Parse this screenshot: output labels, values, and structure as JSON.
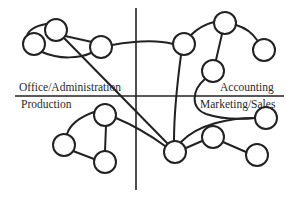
{
  "diagram": {
    "type": "network-quadrant",
    "quadrant_labels": {
      "top_left": "Office/Administration",
      "top_right": "Accounting",
      "bottom_left": "Production",
      "bottom_right": "Marketing/Sales"
    },
    "colors": {
      "stroke": "#222222",
      "node_fill": "#ffffff",
      "text": "#2a2a2a",
      "background": "#ffffff"
    },
    "axes": {
      "vertical": {
        "x": 136,
        "y1": 8,
        "y2": 190
      },
      "horizontal": {
        "y": 96,
        "x1": 15,
        "x2": 284
      }
    },
    "nodes": [
      {
        "id": "A",
        "quadrant": "top_left",
        "cx": 56,
        "cy": 30,
        "r": 11
      },
      {
        "id": "B",
        "quadrant": "top_left",
        "cx": 34,
        "cy": 44,
        "r": 11
      },
      {
        "id": "C",
        "quadrant": "top_left",
        "cx": 101,
        "cy": 47,
        "r": 11
      },
      {
        "id": "D",
        "quadrant": "top_right",
        "cx": 184,
        "cy": 44,
        "r": 11
      },
      {
        "id": "E",
        "quadrant": "top_right",
        "cx": 225,
        "cy": 23,
        "r": 11
      },
      {
        "id": "F",
        "quadrant": "top_right",
        "cx": 264,
        "cy": 50,
        "r": 11
      },
      {
        "id": "G",
        "quadrant": "top_right",
        "cx": 213,
        "cy": 71,
        "r": 11
      },
      {
        "id": "H",
        "quadrant": "bottom_left",
        "cx": 105,
        "cy": 115,
        "r": 11
      },
      {
        "id": "I",
        "quadrant": "bottom_left",
        "cx": 64,
        "cy": 145,
        "r": 11
      },
      {
        "id": "J",
        "quadrant": "bottom_left",
        "cx": 105,
        "cy": 162,
        "r": 11
      },
      {
        "id": "K",
        "quadrant": "bottom_right",
        "cx": 175,
        "cy": 152,
        "r": 11
      },
      {
        "id": "L",
        "quadrant": "bottom_right",
        "cx": 266,
        "cy": 118,
        "r": 11
      },
      {
        "id": "M",
        "quadrant": "bottom_right",
        "cx": 213,
        "cy": 137,
        "r": 11
      },
      {
        "id": "N",
        "quadrant": "bottom_right",
        "cx": 257,
        "cy": 155,
        "r": 11
      }
    ],
    "edges": [
      [
        "A",
        "B"
      ],
      [
        "B",
        "C"
      ],
      [
        "A",
        "C"
      ],
      [
        "A",
        "K"
      ],
      [
        "C",
        "D"
      ],
      [
        "D",
        "E"
      ],
      [
        "E",
        "F"
      ],
      [
        "E",
        "G"
      ],
      [
        "D",
        "K"
      ],
      [
        "G",
        "L"
      ],
      [
        "H",
        "I"
      ],
      [
        "H",
        "J"
      ],
      [
        "I",
        "J"
      ],
      [
        "H",
        "K"
      ],
      [
        "K",
        "L"
      ],
      [
        "K",
        "M"
      ],
      [
        "M",
        "N"
      ]
    ]
  }
}
